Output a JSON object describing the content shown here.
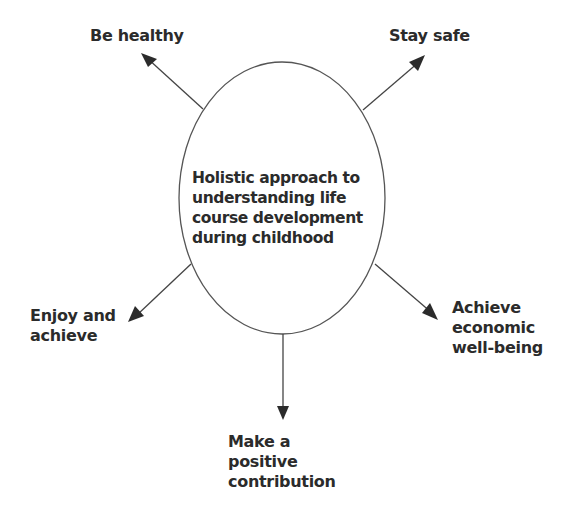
{
  "diagram": {
    "center": {
      "text": "Holistic approach to\nunderstanding life\ncourse development\nduring childhood"
    },
    "outcomes": [
      {
        "id": "be-healthy",
        "text": "Be healthy",
        "direction": "up-left"
      },
      {
        "id": "stay-safe",
        "text": "Stay safe",
        "direction": "up-right"
      },
      {
        "id": "enjoy-and-achieve",
        "text": "Enjoy and\nachieve",
        "direction": "down-left"
      },
      {
        "id": "achieve-economic-well-being",
        "text": "Achieve\neconomic\nwell-being",
        "direction": "down-right"
      },
      {
        "id": "make-a-positive-contribution",
        "text": "Make a\npositive\ncontribution",
        "direction": "down"
      }
    ],
    "colors": {
      "line": "#4a4a4a",
      "text": "#2b2b2b",
      "background": "#ffffff"
    }
  }
}
